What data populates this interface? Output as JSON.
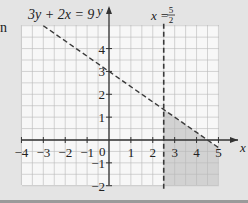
{
  "margin_mark": "n",
  "chart_data": {
    "type": "line",
    "title": "",
    "xlabel": "x",
    "ylabel": "y",
    "xlim": [
      -4,
      5
    ],
    "ylim": [
      -2,
      5
    ],
    "grid": true,
    "minor_grid_step": 0.5,
    "x_ticks": [
      -4,
      -3,
      -2,
      -1,
      0,
      1,
      2,
      3,
      4,
      5
    ],
    "y_ticks": [
      -2,
      -1,
      1,
      2,
      3,
      4
    ],
    "x_tick_labels": [
      "−4",
      "−3",
      "−2",
      "−1",
      "0",
      "1",
      "2",
      "3",
      "4",
      "5"
    ],
    "y_tick_labels": [
      "−2",
      "−1",
      "1",
      "2",
      "3",
      "4"
    ],
    "series": [
      {
        "name": "3y + 2x = 9",
        "style": "dashed",
        "points": [
          [
            -3,
            5
          ],
          [
            4.5,
            0
          ],
          [
            5,
            -0.333
          ]
        ],
        "label": "3y + 2x = 9"
      },
      {
        "name": "x = 5/2",
        "style": "dashed",
        "points": [
          [
            2.5,
            5
          ],
          [
            2.5,
            -2
          ]
        ],
        "label": "x = 5/2"
      }
    ],
    "shaded_region": {
      "description": "x ≥ 5/2 and 3y + 2x ≤ 9 (grey region)",
      "color": "#cfcfcf"
    },
    "annotations": [
      {
        "text": "3y + 2x = 9",
        "near": [
          -2.5,
          5.3
        ]
      },
      {
        "text": "x = 5/2",
        "near": [
          2.5,
          5.3
        ]
      }
    ]
  },
  "labels": {
    "line1": "3y + 2x = 9",
    "line2_lhs": "x =",
    "line2_num": "5",
    "line2_den": "2",
    "x_axis": "x",
    "y_axis": "y",
    "origin": "0"
  },
  "colors": {
    "background": "#e4e4e4",
    "grid_bg": "#f7f7f7",
    "grid_line": "#b8b8b8",
    "shade": "#d2d2d2",
    "axis": "#333333",
    "dash": "#3a3a3a"
  }
}
